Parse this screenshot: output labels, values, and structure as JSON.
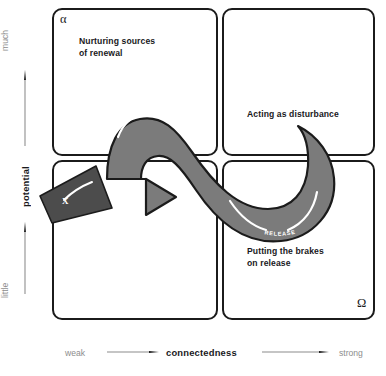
{
  "diagram": {
    "colors": {
      "loop_fill": "#7b7b7b",
      "loop_stroke": "#1b1b1b",
      "exit_arrow_fill": "#4c4c4c",
      "box_stroke": "#1b1b1b",
      "axis_muted_text": "#8d8d8d",
      "axis_bold_text": "#19191c",
      "background": "#ffffff",
      "highlight_stroke": "#ffffff"
    }
  },
  "quadrants": [
    {
      "id": "top-left",
      "marker": "α",
      "caption": "Nurturing sources\nof renewal"
    },
    {
      "id": "top-right",
      "marker": "",
      "caption": "Acting as disturbance"
    },
    {
      "id": "bottom-left",
      "marker": "",
      "caption": ""
    },
    {
      "id": "bottom-right",
      "marker": "Ω",
      "caption": "Putting the brakes\non release"
    }
  ],
  "markers": {
    "alpha": "α",
    "omega": "Ω"
  },
  "loop": {
    "labels": {
      "reorganization": "REORGANIZATION",
      "release": "RELEASE"
    },
    "exit_arrow_label": "X"
  },
  "axes": {
    "y": {
      "title": "potential",
      "low": "little",
      "high": "much",
      "direction": "up"
    },
    "x": {
      "title": "connectedness",
      "low": "weak",
      "high": "strong",
      "direction": "right"
    }
  }
}
